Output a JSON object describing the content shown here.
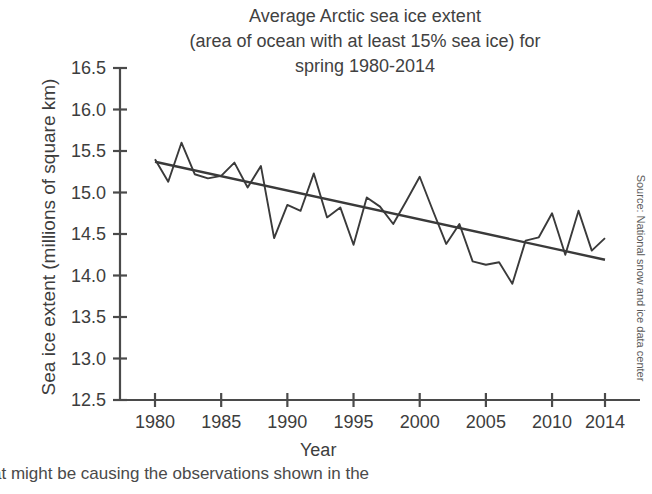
{
  "chart_data": {
    "type": "line",
    "title": "Average Arctic sea ice extent\n(area of ocean with at least 15% sea ice) for\nspring 1980-2014",
    "xlabel": "Year",
    "ylabel": "Sea ice extent (millions of square km)",
    "xlim": [
      1980,
      2014
    ],
    "ylim": [
      12.5,
      16.5
    ],
    "yticks": [
      "16.5",
      "16.0",
      "15.5",
      "15.0",
      "14.5",
      "14.0",
      "13.5",
      "13.0",
      "12.5"
    ],
    "ytick_values": [
      16.5,
      16.0,
      15.5,
      15.0,
      14.5,
      14.0,
      13.5,
      13.0,
      12.5
    ],
    "xticks": [
      "1980",
      "1985",
      "1990",
      "1995",
      "2000",
      "2005",
      "2010",
      "2014"
    ],
    "xtick_values": [
      1980,
      1985,
      1990,
      1995,
      2000,
      2005,
      2010,
      2014
    ],
    "grid": false,
    "legend": false,
    "source_note": "Source: National snow and ice data center",
    "x": [
      1980,
      1981,
      1982,
      1983,
      1984,
      1985,
      1986,
      1987,
      1988,
      1989,
      1990,
      1991,
      1992,
      1993,
      1994,
      1995,
      1996,
      1997,
      1998,
      1999,
      2000,
      2001,
      2002,
      2003,
      2004,
      2005,
      2006,
      2007,
      2008,
      2009,
      2010,
      2011,
      2012,
      2013,
      2014
    ],
    "series": [
      {
        "name": "Average Arctic sea ice extent",
        "color": "#3a3a3a",
        "values": [
          15.4,
          15.13,
          15.6,
          15.22,
          15.17,
          15.2,
          15.36,
          15.06,
          15.32,
          14.45,
          14.85,
          14.78,
          15.23,
          14.7,
          14.82,
          14.37,
          14.94,
          14.83,
          14.62,
          14.9,
          15.19,
          14.78,
          14.38,
          14.62,
          14.17,
          14.13,
          14.16,
          13.9,
          14.42,
          14.46,
          14.75,
          14.25,
          14.78,
          14.3,
          14.45
        ]
      },
      {
        "name": "Linear trend",
        "color": "#3a3a3a",
        "type": "trend",
        "start": {
          "x": 1980,
          "y": 15.37
        },
        "end": {
          "x": 2014,
          "y": 14.19
        }
      }
    ]
  },
  "caption": {
    "text": "at might be causing the observations shown in the"
  }
}
